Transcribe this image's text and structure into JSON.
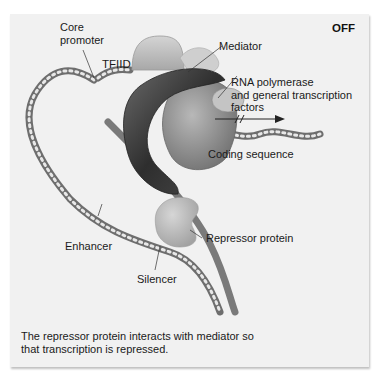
{
  "figure": {
    "state_label": "OFF",
    "labels": {
      "core_promoter": [
        "Core",
        "promoter"
      ],
      "tfiid": "TFIID",
      "mediator": "Mediator",
      "rna_polymerase": [
        "RNA polymerase",
        "and general transcription",
        "factors"
      ],
      "coding_sequence": "Coding sequence",
      "repressor_protein": "Repressor protein",
      "enhancer": "Enhancer",
      "silencer": "Silencer"
    },
    "caption": [
      "The repressor protein interacts with mediator so",
      "that transcription is repressed."
    ],
    "colors": {
      "panel_bg": "#f1f1f1",
      "dna": "#7a7a7a",
      "mediator": "#3a3a3a",
      "tfiid": "#c8c8c8",
      "polymerase": "#9a9a9a",
      "repressor": "#bdbdbd"
    }
  }
}
